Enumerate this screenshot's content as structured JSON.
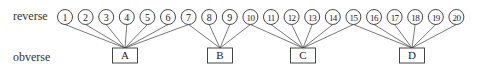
{
  "labels": {
    "reverse": "reverse",
    "obverse": "obverse"
  },
  "reverse_dies": [
    "1",
    "2",
    "3",
    "4",
    "5",
    "6",
    "7",
    "8",
    "9",
    "10",
    "11",
    "12",
    "13",
    "14",
    "15",
    "16",
    "17",
    "18",
    "19",
    "20"
  ],
  "obverse_dies": [
    "A",
    "B",
    "C",
    "D"
  ],
  "links": [
    {
      "reverse": "1",
      "obverse": "A"
    },
    {
      "reverse": "2",
      "obverse": "A"
    },
    {
      "reverse": "3",
      "obverse": "A"
    },
    {
      "reverse": "4",
      "obverse": "A"
    },
    {
      "reverse": "5",
      "obverse": "A"
    },
    {
      "reverse": "6",
      "obverse": "A"
    },
    {
      "reverse": "7",
      "obverse": "A"
    },
    {
      "reverse": "7",
      "obverse": "B"
    },
    {
      "reverse": "8",
      "obverse": "B"
    },
    {
      "reverse": "9",
      "obverse": "B"
    },
    {
      "reverse": "10",
      "obverse": "B"
    },
    {
      "reverse": "10",
      "obverse": "C"
    },
    {
      "reverse": "11",
      "obverse": "C"
    },
    {
      "reverse": "12",
      "obverse": "C"
    },
    {
      "reverse": "13",
      "obverse": "C"
    },
    {
      "reverse": "14",
      "obverse": "C"
    },
    {
      "reverse": "15",
      "obverse": "C"
    },
    {
      "reverse": "15",
      "obverse": "D"
    },
    {
      "reverse": "16",
      "obverse": "D"
    },
    {
      "reverse": "17",
      "obverse": "D"
    },
    {
      "reverse": "18",
      "obverse": "D"
    },
    {
      "reverse": "19",
      "obverse": "D"
    },
    {
      "reverse": "20",
      "obverse": "D"
    }
  ],
  "colors": {
    "stroke": "#333333",
    "link": "#555555",
    "text": "#222222",
    "background": "#ffffff"
  }
}
